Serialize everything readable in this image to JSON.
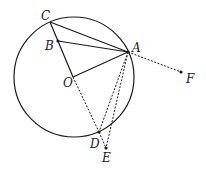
{
  "figure": {
    "circle": {
      "center": "O",
      "cx": 74,
      "cy": 77,
      "r": 60
    },
    "points": [
      {
        "id": "C",
        "label": "C",
        "x": 50,
        "y": 22,
        "lx": 41,
        "ly": 20
      },
      {
        "id": "B",
        "label": "B",
        "x": 58,
        "y": 41,
        "lx": 45,
        "ly": 50
      },
      {
        "id": "O",
        "label": "O",
        "x": 73,
        "y": 77,
        "lx": 63,
        "ly": 87
      },
      {
        "id": "A",
        "label": "A",
        "x": 128,
        "y": 52,
        "lx": 132,
        "ly": 52
      },
      {
        "id": "D",
        "label": "D",
        "x": 99,
        "y": 132,
        "lx": 90,
        "ly": 148
      },
      {
        "id": "E",
        "label": "E",
        "x": 106,
        "y": 148,
        "lx": 102,
        "ly": 162
      },
      {
        "id": "F",
        "label": "F",
        "x": 181,
        "y": 72,
        "lx": 186,
        "ly": 83
      }
    ],
    "solid_segments": [
      [
        "C",
        "A"
      ],
      [
        "B",
        "A"
      ],
      [
        "C",
        "O"
      ],
      [
        "O",
        "A"
      ]
    ],
    "dashed_segments": [
      [
        "O",
        "D"
      ],
      [
        "A",
        "D"
      ],
      [
        "A",
        "E"
      ],
      [
        "D",
        "E"
      ],
      [
        "A",
        "F"
      ]
    ],
    "colors": {
      "stroke": "#1a1a1a",
      "background": "#ffffff"
    }
  }
}
